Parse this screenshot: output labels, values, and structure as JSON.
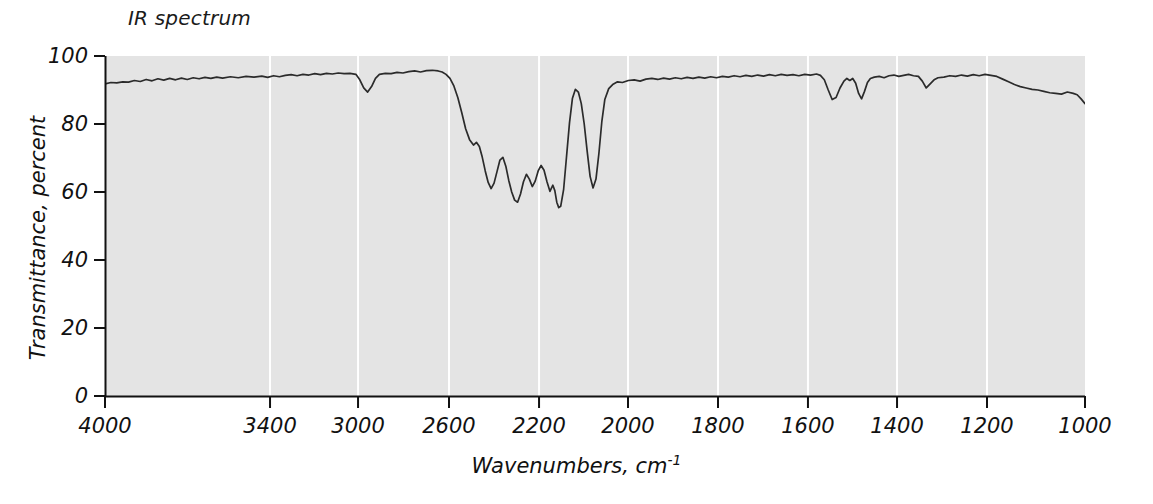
{
  "chart_data": {
    "type": "line",
    "title": "IR spectrum",
    "xlabel": "Wavenumbers, cm",
    "xlabel_superscript": "-1",
    "ylabel": "Transmittance, percent",
    "xlim": [
      4000,
      1000
    ],
    "ylim": [
      0,
      100
    ],
    "x_inverted": true,
    "grid": "vertical-white-gridlines",
    "background_color": "#e4e4e4",
    "line_color": "#2b2b2b",
    "xticks": [
      4000,
      3400,
      3000,
      2600,
      2200,
      2000,
      1800,
      1600,
      1400,
      1200,
      1000
    ],
    "xtick_labels": [
      "4000",
      "3400",
      "3000",
      "2600",
      "2200",
      "2000",
      "1800",
      "1600",
      "1400",
      "1200",
      "1000"
    ],
    "xtick_pixel_fractions": [
      0.0,
      0.1684,
      0.2582,
      0.351,
      0.4429,
      0.5337,
      0.6255,
      0.7173,
      0.8082,
      0.9,
      1.0
    ],
    "yticks": [
      0,
      20,
      40,
      60,
      80,
      100
    ],
    "ytick_labels": [
      "0",
      "20",
      "40",
      "60",
      "80",
      "100"
    ],
    "series": [
      {
        "name": "transmittance",
        "units": "percent",
        "points": [
          [
            0.0,
            91.8
          ],
          [
            0.006,
            92.2
          ],
          [
            0.012,
            92.1
          ],
          [
            0.018,
            92.4
          ],
          [
            0.024,
            92.3
          ],
          [
            0.03,
            92.8
          ],
          [
            0.036,
            92.5
          ],
          [
            0.042,
            93.1
          ],
          [
            0.048,
            92.7
          ],
          [
            0.054,
            93.3
          ],
          [
            0.06,
            92.9
          ],
          [
            0.066,
            93.4
          ],
          [
            0.072,
            93.0
          ],
          [
            0.078,
            93.5
          ],
          [
            0.084,
            93.1
          ],
          [
            0.09,
            93.6
          ],
          [
            0.096,
            93.3
          ],
          [
            0.102,
            93.7
          ],
          [
            0.108,
            93.4
          ],
          [
            0.114,
            93.8
          ],
          [
            0.12,
            93.5
          ],
          [
            0.128,
            93.9
          ],
          [
            0.136,
            93.6
          ],
          [
            0.144,
            94.0
          ],
          [
            0.152,
            93.8
          ],
          [
            0.16,
            94.1
          ],
          [
            0.166,
            93.7
          ],
          [
            0.172,
            94.2
          ],
          [
            0.178,
            93.9
          ],
          [
            0.184,
            94.3
          ],
          [
            0.19,
            94.5
          ],
          [
            0.196,
            94.2
          ],
          [
            0.202,
            94.6
          ],
          [
            0.208,
            94.4
          ],
          [
            0.214,
            94.8
          ],
          [
            0.22,
            94.5
          ],
          [
            0.226,
            94.9
          ],
          [
            0.232,
            94.7
          ],
          [
            0.238,
            95.0
          ],
          [
            0.244,
            94.8
          ],
          [
            0.25,
            94.9
          ],
          [
            0.256,
            94.6
          ],
          [
            0.26,
            93.0
          ],
          [
            0.264,
            90.6
          ],
          [
            0.268,
            89.4
          ],
          [
            0.272,
            91.0
          ],
          [
            0.276,
            93.4
          ],
          [
            0.28,
            94.6
          ],
          [
            0.286,
            94.9
          ],
          [
            0.292,
            94.8
          ],
          [
            0.298,
            95.2
          ],
          [
            0.304,
            95.0
          ],
          [
            0.31,
            95.4
          ],
          [
            0.316,
            95.6
          ],
          [
            0.322,
            95.3
          ],
          [
            0.328,
            95.7
          ],
          [
            0.334,
            95.8
          ],
          [
            0.34,
            95.6
          ],
          [
            0.344,
            95.3
          ],
          [
            0.348,
            94.6
          ],
          [
            0.352,
            93.4
          ],
          [
            0.356,
            91.2
          ],
          [
            0.36,
            87.8
          ],
          [
            0.364,
            83.4
          ],
          [
            0.368,
            78.6
          ],
          [
            0.372,
            75.4
          ],
          [
            0.376,
            73.8
          ],
          [
            0.379,
            74.6
          ],
          [
            0.382,
            73.4
          ],
          [
            0.385,
            70.2
          ],
          [
            0.388,
            66.2
          ],
          [
            0.391,
            62.8
          ],
          [
            0.394,
            61.0
          ],
          [
            0.397,
            62.6
          ],
          [
            0.4,
            66.0
          ],
          [
            0.403,
            69.4
          ],
          [
            0.406,
            70.2
          ],
          [
            0.409,
            67.6
          ],
          [
            0.412,
            63.4
          ],
          [
            0.415,
            60.0
          ],
          [
            0.418,
            57.6
          ],
          [
            0.421,
            57.0
          ],
          [
            0.424,
            59.4
          ],
          [
            0.427,
            63.0
          ],
          [
            0.43,
            65.2
          ],
          [
            0.433,
            63.8
          ],
          [
            0.436,
            61.6
          ],
          [
            0.439,
            63.2
          ],
          [
            0.442,
            66.2
          ],
          [
            0.445,
            67.8
          ],
          [
            0.448,
            66.4
          ],
          [
            0.451,
            63.0
          ],
          [
            0.454,
            60.2
          ],
          [
            0.457,
            62.0
          ],
          [
            0.459,
            60.4
          ],
          [
            0.461,
            57.0
          ],
          [
            0.463,
            55.4
          ],
          [
            0.465,
            55.8
          ],
          [
            0.468,
            60.8
          ],
          [
            0.471,
            70.6
          ],
          [
            0.474,
            80.4
          ],
          [
            0.477,
            87.6
          ],
          [
            0.48,
            90.2
          ],
          [
            0.483,
            89.4
          ],
          [
            0.486,
            86.0
          ],
          [
            0.489,
            80.0
          ],
          [
            0.492,
            72.0
          ],
          [
            0.495,
            64.6
          ],
          [
            0.498,
            61.2
          ],
          [
            0.501,
            63.8
          ],
          [
            0.504,
            71.4
          ],
          [
            0.507,
            80.8
          ],
          [
            0.51,
            87.2
          ],
          [
            0.514,
            90.4
          ],
          [
            0.518,
            91.6
          ],
          [
            0.523,
            92.4
          ],
          [
            0.528,
            92.2
          ],
          [
            0.534,
            92.8
          ],
          [
            0.54,
            93.0
          ],
          [
            0.546,
            92.6
          ],
          [
            0.552,
            93.2
          ],
          [
            0.558,
            93.4
          ],
          [
            0.564,
            93.1
          ],
          [
            0.57,
            93.5
          ],
          [
            0.576,
            93.2
          ],
          [
            0.582,
            93.6
          ],
          [
            0.588,
            93.3
          ],
          [
            0.594,
            93.7
          ],
          [
            0.6,
            93.4
          ],
          [
            0.606,
            93.8
          ],
          [
            0.612,
            93.5
          ],
          [
            0.618,
            93.9
          ],
          [
            0.624,
            93.6
          ],
          [
            0.63,
            94.0
          ],
          [
            0.636,
            93.8
          ],
          [
            0.642,
            94.2
          ],
          [
            0.648,
            93.9
          ],
          [
            0.654,
            94.3
          ],
          [
            0.66,
            94.0
          ],
          [
            0.666,
            94.4
          ],
          [
            0.672,
            94.1
          ],
          [
            0.678,
            94.5
          ],
          [
            0.684,
            94.2
          ],
          [
            0.69,
            94.6
          ],
          [
            0.696,
            94.3
          ],
          [
            0.702,
            94.5
          ],
          [
            0.708,
            94.2
          ],
          [
            0.714,
            94.6
          ],
          [
            0.72,
            94.4
          ],
          [
            0.726,
            94.7
          ],
          [
            0.73,
            94.3
          ],
          [
            0.734,
            93.0
          ],
          [
            0.738,
            90.0
          ],
          [
            0.742,
            87.2
          ],
          [
            0.746,
            87.8
          ],
          [
            0.75,
            90.6
          ],
          [
            0.754,
            92.6
          ],
          [
            0.757,
            93.4
          ],
          [
            0.76,
            92.8
          ],
          [
            0.763,
            93.4
          ],
          [
            0.766,
            92.0
          ],
          [
            0.769,
            89.0
          ],
          [
            0.772,
            87.4
          ],
          [
            0.775,
            89.6
          ],
          [
            0.778,
            92.2
          ],
          [
            0.781,
            93.4
          ],
          [
            0.785,
            93.8
          ],
          [
            0.79,
            94.0
          ],
          [
            0.795,
            93.6
          ],
          [
            0.8,
            94.2
          ],
          [
            0.805,
            94.4
          ],
          [
            0.81,
            94.0
          ],
          [
            0.815,
            94.3
          ],
          [
            0.82,
            94.6
          ],
          [
            0.825,
            94.2
          ],
          [
            0.83,
            94.0
          ],
          [
            0.834,
            92.6
          ],
          [
            0.838,
            90.6
          ],
          [
            0.842,
            91.8
          ],
          [
            0.846,
            93.0
          ],
          [
            0.85,
            93.6
          ],
          [
            0.856,
            93.8
          ],
          [
            0.862,
            94.2
          ],
          [
            0.868,
            94.0
          ],
          [
            0.874,
            94.4
          ],
          [
            0.88,
            94.1
          ],
          [
            0.886,
            94.5
          ],
          [
            0.892,
            94.2
          ],
          [
            0.898,
            94.6
          ],
          [
            0.904,
            94.3
          ],
          [
            0.91,
            94.0
          ],
          [
            0.916,
            93.2
          ],
          [
            0.922,
            92.4
          ],
          [
            0.928,
            91.6
          ],
          [
            0.934,
            91.0
          ],
          [
            0.94,
            90.6
          ],
          [
            0.946,
            90.2
          ],
          [
            0.952,
            90.0
          ],
          [
            0.958,
            89.6
          ],
          [
            0.964,
            89.2
          ],
          [
            0.97,
            89.0
          ],
          [
            0.976,
            88.8
          ],
          [
            0.982,
            89.4
          ],
          [
            0.988,
            89.0
          ],
          [
            0.992,
            88.6
          ],
          [
            0.996,
            87.4
          ],
          [
            1.0,
            86.0
          ]
        ]
      }
    ],
    "annotations": {
      "note": "Single IR transmittance trace; x axis plotted with non-uniform spacing (4000-3400 wider than subsequent 400-unit steps)."
    }
  },
  "figure": {
    "title": "IR spectrum"
  }
}
